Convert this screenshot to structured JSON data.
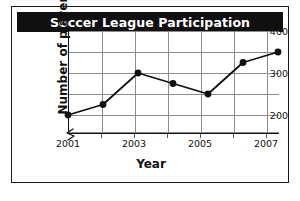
{
  "chart_data": {
    "type": "line",
    "title": "Soccer League Participation",
    "xlabel": "Year",
    "ylabel": "Number of players",
    "categories": [
      2001,
      2002,
      2003,
      2004,
      2005,
      2006,
      2007
    ],
    "values": [
      200,
      225,
      300,
      275,
      250,
      325,
      350
    ],
    "x": [
      2001,
      2002,
      2003,
      2004,
      2005,
      2006,
      2007
    ],
    "series": [
      {
        "name": "Number of players",
        "values": [
          200,
          225,
          300,
          275,
          250,
          325,
          350
        ]
      }
    ],
    "xlim": [
      2001,
      2007
    ],
    "ylim": [
      175,
      400
    ],
    "y_axis_break": true,
    "y_ticks": [
      200,
      300,
      400
    ],
    "y_tick_labels": [
      "200",
      "300",
      "400"
    ],
    "y_minor_gridlines": [
      250,
      350
    ],
    "x_ticks": [
      2001,
      2002,
      2003,
      2004,
      2005,
      2006,
      2007
    ],
    "x_tick_labels": [
      "2001",
      "",
      "2003",
      "",
      "2005",
      "",
      "2007"
    ],
    "x_tick_labels_visible": [
      "2001",
      "2003",
      "2005",
      "2007"
    ],
    "grid": true,
    "legend": false,
    "marker": "filled-circle",
    "line_color": "#101010",
    "marker_color": "#101010",
    "grid_color": "#8c8c8c",
    "title_background": "#101010",
    "title_color": "#ffffff",
    "plot_background": "#ffffff"
  },
  "axes": {
    "y_labels": [
      {
        "text": "400",
        "value": 400
      },
      {
        "text": "300",
        "value": 300
      },
      {
        "text": "200",
        "value": 200
      }
    ],
    "x_labels": [
      {
        "text": "2001",
        "value": 2001
      },
      {
        "text": "2003",
        "value": 2003
      },
      {
        "text": "2005",
        "value": 2005
      },
      {
        "text": "2007",
        "value": 2007
      }
    ]
  }
}
